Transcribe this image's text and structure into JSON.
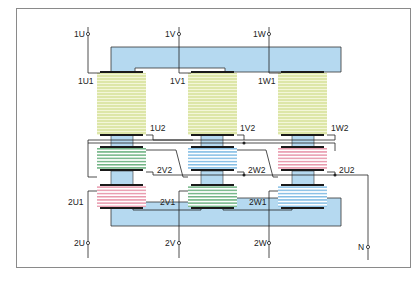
{
  "diagram": {
    "type": "three-phase-transformer-winding-diagram",
    "colors": {
      "frame": "#8a8a8a",
      "core": "#b5d9f0",
      "core_border": "#333333",
      "primary_coil": "#dde6a8",
      "primary_stripe": "#f3f6d8",
      "coil_green": "#3f9a5a",
      "coil_blue": "#5aa8dc",
      "coil_pink": "#e0758f",
      "wire": "#222222",
      "yoke_bar": "#1a1a1a"
    },
    "primary_terminals": [
      {
        "id": "1U",
        "label": "1U"
      },
      {
        "id": "1V",
        "label": "1V"
      },
      {
        "id": "1W",
        "label": "1W"
      }
    ],
    "primary_winding_starts": [
      {
        "label": "1U1"
      },
      {
        "label": "1V1"
      },
      {
        "label": "1W1"
      }
    ],
    "primary_winding_ends": [
      {
        "label": "1U2"
      },
      {
        "label": "1V2"
      },
      {
        "label": "1W2"
      }
    ],
    "secondary_upper_labels": [
      {
        "label": "2V2"
      },
      {
        "label": "2W2"
      },
      {
        "label": "2U2"
      }
    ],
    "secondary_lower_labels": [
      {
        "label": "2U1"
      },
      {
        "label": "2V1"
      },
      {
        "label": "2W1"
      }
    ],
    "secondary_terminals": [
      {
        "id": "2U",
        "label": "2U"
      },
      {
        "id": "2V",
        "label": "2V"
      },
      {
        "id": "2W",
        "label": "2W"
      },
      {
        "id": "N",
        "label": "N"
      }
    ],
    "legs": [
      {
        "name": "leg-1",
        "upper_secondary_color": "green",
        "lower_secondary_color": "pink"
      },
      {
        "name": "leg-2",
        "upper_secondary_color": "blue",
        "lower_secondary_color": "green"
      },
      {
        "name": "leg-3",
        "upper_secondary_color": "pink",
        "lower_secondary_color": "blue"
      }
    ]
  }
}
